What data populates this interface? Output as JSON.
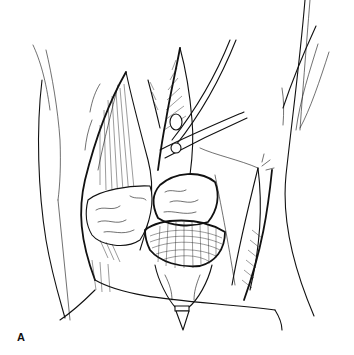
{
  "figure": {
    "panel_label": "A",
    "colors": {
      "background": "#ffffff",
      "ink": "#111111"
    }
  }
}
